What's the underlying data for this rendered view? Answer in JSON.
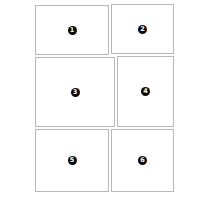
{
  "layout": {
    "panels": [
      {
        "number": "1",
        "x": 35,
        "y": 5,
        "w": 74,
        "h": 50
      },
      {
        "number": "2",
        "x": 111,
        "y": 4,
        "w": 63,
        "h": 50
      },
      {
        "number": "3",
        "x": 35,
        "y": 57,
        "w": 80,
        "h": 70
      },
      {
        "number": "4",
        "x": 117,
        "y": 56,
        "w": 57,
        "h": 71
      },
      {
        "number": "5",
        "x": 35,
        "y": 129,
        "w": 74,
        "h": 63
      },
      {
        "number": "6",
        "x": 111,
        "y": 129,
        "w": 63,
        "h": 63
      }
    ]
  },
  "colors": {
    "border": "#b8b8b8",
    "badge": "#0a0a0a",
    "badge_text": "#ffffff"
  }
}
